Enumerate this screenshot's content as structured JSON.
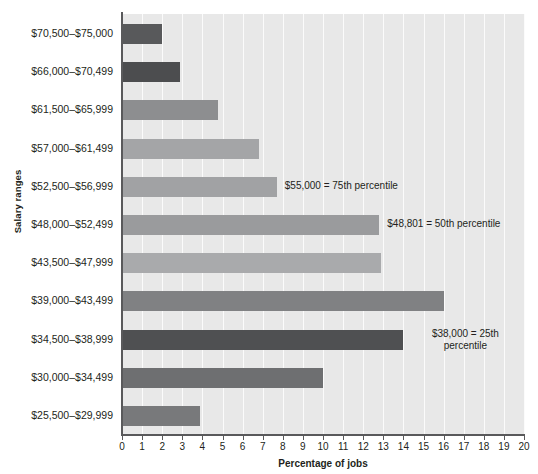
{
  "chart_data": {
    "type": "bar",
    "orientation": "horizontal",
    "title": "",
    "xlabel": "Percentage of jobs",
    "ylabel": "Salary ranges",
    "xlim": [
      0,
      20
    ],
    "grid": true,
    "legend": "none",
    "xticks": [
      "0",
      "1",
      "2",
      "3",
      "4",
      "5",
      "6",
      "7",
      "8",
      "9",
      "10",
      "11",
      "12",
      "13",
      "14",
      "15",
      "16",
      "17",
      "18",
      "19",
      "20"
    ],
    "categories": [
      "$70,500–$75,000",
      "$66,000–$70,499",
      "$61,500–$65,999",
      "$57,000–$61,499",
      "$52,500–$56,999",
      "$48,000–$52,499",
      "$43,500–$47,999",
      "$39,000–$43,499",
      "$34,500–$38,999",
      "$30,000–$34,499",
      "$25,500–$29,999"
    ],
    "values": [
      2.0,
      2.9,
      4.8,
      6.8,
      7.7,
      12.8,
      12.9,
      16.0,
      14.0,
      10.0,
      3.9
    ],
    "bar_colors": [
      "#58595b",
      "#4c4d4f",
      "#8d8e90",
      "#a4a5a7",
      "#a1a2a4",
      "#9a9b9d",
      "#a9aaac",
      "#808183",
      "#4f5052",
      "#6e6f71",
      "#78797b"
    ],
    "plot_background": "#e8e8e8",
    "gridline_color": "#fbfbfb",
    "axis_color": "#59595b",
    "annotations": [
      {
        "text": "$55,000 = 75th percentile",
        "category": "$52,500–$56,999",
        "lines": [
          "$55,000 = 75th percentile"
        ]
      },
      {
        "text": "$48,801 = 50th percentile",
        "category": "$48,000–$52,499",
        "lines": [
          "$48,801 = 50th percentile"
        ]
      },
      {
        "text": "$38,000 = 25th percentile",
        "category": "$34,500–$38,999",
        "lines": [
          "$38,000 = 25th",
          "percentile"
        ]
      }
    ]
  },
  "axes": {
    "y_title": "Salary ranges",
    "x_title": "Percentage of jobs"
  },
  "annotation_text": {
    "p75": "$55,000 = 75th percentile",
    "p50": "$48,801 = 50th percentile",
    "p25_line1": "$38,000 = 25th",
    "p25_line2": "percentile"
  }
}
